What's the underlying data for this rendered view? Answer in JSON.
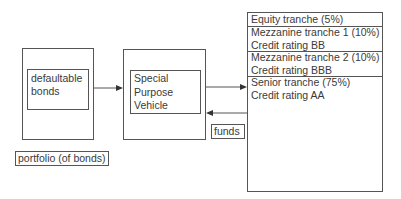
{
  "portfolio": {
    "inner_label": "defaultable bonds",
    "inner_lines": [
      "defaultable",
      "bonds"
    ],
    "caption": "portfolio (of bonds)"
  },
  "spv": {
    "lines": [
      "Special",
      "Purpose",
      "Vehicle"
    ]
  },
  "funds_label": "funds",
  "tranches": [
    {
      "name": "Equity tranche (5%)",
      "rating": ""
    },
    {
      "name": "Mezzanine tranche 1 (10%)",
      "rating": "Credit rating BB"
    },
    {
      "name": "Mezzanine tranche 2 (10%)",
      "rating": "Credit rating BBB"
    },
    {
      "name": "Senior tranche  (75%)",
      "rating": "Credit rating AA"
    }
  ],
  "colors": {
    "line": "#555555",
    "text": "#3a3a3a",
    "background": "#ffffff"
  }
}
